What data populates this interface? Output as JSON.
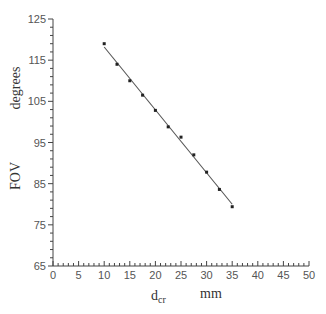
{
  "chart_data": {
    "type": "scatter",
    "title": "",
    "xlabel": "d_cr",
    "xlabel_main": "d",
    "xlabel_sub": "cr",
    "xunit": "mm",
    "ylabel": "FOV",
    "yunit": "degrees",
    "xlim": [
      0,
      50
    ],
    "ylim": [
      65,
      125
    ],
    "xticks": [
      0,
      5,
      10,
      15,
      20,
      25,
      30,
      35,
      40,
      45,
      50
    ],
    "yticks": [
      65,
      75,
      85,
      95,
      105,
      115,
      125
    ],
    "grid": false,
    "legend": null,
    "series": [
      {
        "name": "measured",
        "marker": "dot",
        "x": [
          10,
          12.5,
          15,
          17.5,
          20,
          22.5,
          25,
          27.5,
          30,
          32.5,
          35
        ],
        "y": [
          119,
          114,
          110,
          106.5,
          102.8,
          98.8,
          96.3,
          92,
          87.8,
          83.6,
          79.4
        ]
      },
      {
        "name": "linear fit",
        "type": "line",
        "x": [
          10,
          35
        ],
        "y": [
          118.2,
          80.0
        ]
      }
    ]
  },
  "colors": {
    "axis": "#444444",
    "points": "#222222",
    "fit_line": "#555555",
    "text": "#444444"
  }
}
